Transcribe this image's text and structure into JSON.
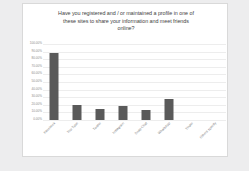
{
  "chart_data": {
    "type": "bar",
    "title": "Have you registered and / or maintained a profile in one of these sites to share your information and meet friends online?",
    "title_lines": [
      "Have you registered and / or maintained a profile in one of",
      "these sites to share your information and meet friends",
      "online?"
    ],
    "categories": [
      "Facebook",
      "You Tube",
      "Twitter",
      "Instagram",
      "Snap Chat",
      "WhatsApp",
      "Tinder",
      "Others specify"
    ],
    "values": [
      88.0,
      20.0,
      14.0,
      19.0,
      13.0,
      27.0,
      0.0,
      0.0
    ],
    "value_labels": [
      "88.00%",
      "20.00%",
      "14.00%",
      "19.00%",
      "13.00%",
      "27.00%",
      "0.00%",
      "0.00%"
    ],
    "xlabel": "",
    "ylabel": "",
    "ylim": [
      0,
      100
    ],
    "ytick_labels": [
      "100.00%",
      "90.00%",
      "80.00%",
      "70.00%",
      "60.00%",
      "50.00%",
      "40.00%",
      "30.00%",
      "20.00%",
      "10.00%",
      "0.00%"
    ],
    "ytick_values": [
      100,
      90,
      80,
      70,
      60,
      50,
      40,
      30,
      20,
      10,
      0
    ],
    "grid": true,
    "legend": false,
    "legend_position": "none",
    "bar_color": "#5a5a5a",
    "plot_background": "#ffffff",
    "gridline_color": "#ededed",
    "axis_text_color": "#8a8a8a",
    "title_color": "#3f3f3f",
    "page_background": "#ededee"
  }
}
